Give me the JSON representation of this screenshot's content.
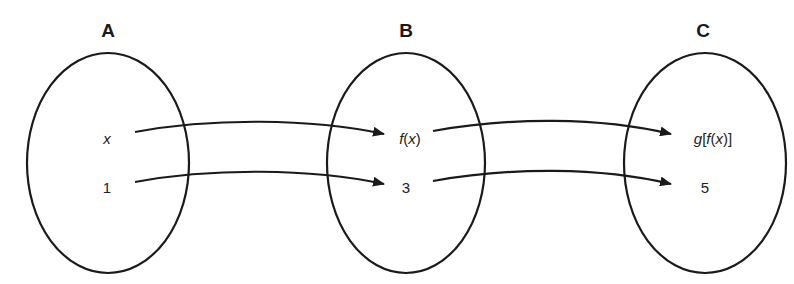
{
  "diagram": {
    "type": "function-composition-mapping",
    "colors": {
      "stroke": "#1a1a1a",
      "text": "#222222",
      "background": "#ffffff"
    },
    "sets": [
      {
        "id": "A",
        "label": "A",
        "elements": [
          {
            "text": "x",
            "italic": true
          },
          {
            "text": "1",
            "italic": false
          }
        ]
      },
      {
        "id": "B",
        "label": "B",
        "elements": [
          {
            "text": "f(x)"
          },
          {
            "text": "3"
          }
        ]
      },
      {
        "id": "C",
        "label": "C",
        "elements": [
          {
            "text": "g[f(x)]"
          },
          {
            "text": "5"
          }
        ]
      }
    ],
    "b_elem0": {
      "f": "f",
      "open": "(",
      "x": "x",
      "close": ")"
    },
    "c_elem0": {
      "g": "g",
      "lb": "[",
      "f": "f",
      "open": "(",
      "x": "x",
      "close": ")",
      "rb": "]"
    },
    "arrows": [
      {
        "from": "x",
        "to": "f(x)"
      },
      {
        "from": "1",
        "to": "3"
      },
      {
        "from": "f(x)",
        "to": "g[f(x)]"
      },
      {
        "from": "3",
        "to": "5"
      }
    ]
  }
}
